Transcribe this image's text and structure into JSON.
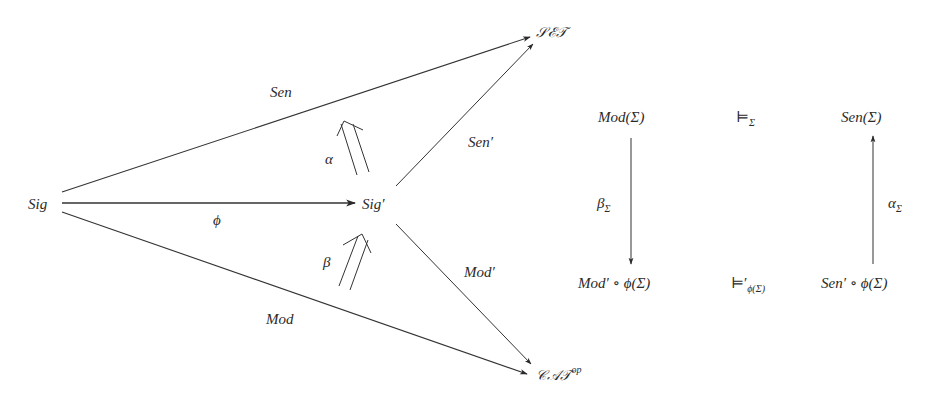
{
  "diagram": {
    "left": {
      "nodes": {
        "sig": "Sig",
        "sig_prime": "Sig′",
        "set": "𝒮ℰ𝒯",
        "cat": "𝒞𝒜𝒯",
        "cat_sup": "op"
      },
      "edges": {
        "sen": "Sen",
        "mod": "Mod",
        "phi": "ϕ",
        "sen_prime": "Sen′",
        "mod_prime": "Mod′"
      },
      "natural_transformations": {
        "alpha": "α",
        "beta": "β"
      }
    },
    "right": {
      "top_left": "Mod(Σ)",
      "top_mid": "⊨",
      "top_mid_sub": "Σ",
      "top_right": "Sen(Σ)",
      "bottom_left": "Mod′ ∘ ϕ(Σ)",
      "bottom_mid": "⊨′",
      "bottom_mid_sub": "ϕ(Σ)",
      "bottom_right": "Sen′ ∘ ϕ(Σ)",
      "left_arrow_label": "β",
      "left_arrow_sub": "Σ",
      "right_arrow_label": "α",
      "right_arrow_sub": "Σ"
    }
  }
}
